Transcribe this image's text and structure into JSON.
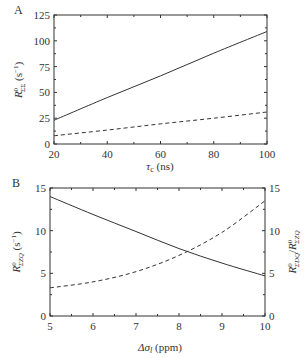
{
  "chart_data": [
    {
      "panel": "A",
      "type": "line",
      "xlabel": "τc (ns)",
      "ylabel": "R0ΣΣ (s−1)",
      "xlim": [
        20,
        100
      ],
      "ylim": [
        0,
        125
      ],
      "xticks": [
        20,
        40,
        60,
        80,
        100
      ],
      "yticks": [
        0,
        25,
        50,
        75,
        100,
        125
      ],
      "grid": false,
      "series": [
        {
          "name": "solid",
          "style": "solid",
          "x": [
            20,
            40,
            60,
            80,
            100
          ],
          "values": [
            23,
            45,
            66,
            88,
            109
          ]
        },
        {
          "name": "dashed",
          "style": "dashed",
          "x": [
            20,
            40,
            60,
            80,
            100
          ],
          "values": [
            8,
            13.5,
            19.5,
            25,
            31
          ]
        }
      ]
    },
    {
      "panel": "B",
      "type": "line",
      "xlabel": "Δσl (ppm)",
      "ylabel": "R0ΣZQ (s−1)",
      "ylabel_right": "R0ΣDQ/R0ΣZQ",
      "xlim": [
        5,
        10
      ],
      "ylim": [
        0,
        15
      ],
      "ylim_right": [
        0,
        15
      ],
      "xticks": [
        5,
        6,
        7,
        8,
        9,
        10
      ],
      "yticks": [
        0,
        5,
        10,
        15
      ],
      "yticks_right": [
        0,
        5,
        10,
        15
      ],
      "grid": false,
      "series": [
        {
          "name": "solid",
          "style": "solid",
          "axis": "left",
          "x": [
            5,
            6,
            7,
            8,
            9,
            10
          ],
          "values": [
            14.0,
            11.9,
            9.9,
            7.9,
            6.2,
            4.7
          ]
        },
        {
          "name": "dashed",
          "style": "dashed",
          "axis": "right",
          "x": [
            5,
            6,
            7,
            8,
            9,
            10
          ],
          "values": [
            3.3,
            4.0,
            5.2,
            7.1,
            9.8,
            13.5
          ]
        }
      ]
    }
  ],
  "labels": {
    "panel_a": "A",
    "panel_b": "B",
    "a_xlabel_main": "τ",
    "a_xlabel_sub": "c",
    "a_xlabel_unit": " (ns)",
    "a_ylabel_main": "R",
    "a_ylabel_sup": "0",
    "a_ylabel_sub": "ΣΣ",
    "a_ylabel_unit": " (s",
    "a_ylabel_unit_sup": "−1",
    "a_ylabel_unit_end": ")",
    "b_xlabel_main": "Δσ",
    "b_xlabel_sub": "l",
    "b_xlabel_unit": " (ppm)",
    "b_ylabel_main": "R",
    "b_ylabel_sup": "0",
    "b_ylabel_sub": "ΣZQ",
    "b_ylabel_unit": " (s",
    "b_ylabel_unit_sup": "−1",
    "b_ylabel_unit_end": ")",
    "b_rlabel_1": "R",
    "b_rlabel_1_sup": "0",
    "b_rlabel_1_sub": "ΣDQ",
    "b_rlabel_slash": "/",
    "b_rlabel_2": "R",
    "b_rlabel_2_sup": "0",
    "b_rlabel_2_sub": "ΣZQ"
  },
  "colors": {
    "line": "#333333",
    "frame": "#333333"
  }
}
